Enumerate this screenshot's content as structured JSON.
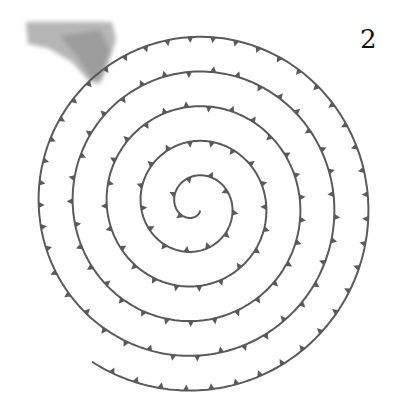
{
  "figure": {
    "number_label": "2",
    "colors": {
      "background": "#ffffff",
      "wire": "#5a5a5a",
      "hand": "#9a9a9a",
      "label": "#111111"
    },
    "spiral": {
      "center_x": 195,
      "center_y": 205,
      "turns": 5.2,
      "start_radius": 8,
      "end_radius": 185,
      "thorn_spacing": 22
    }
  }
}
